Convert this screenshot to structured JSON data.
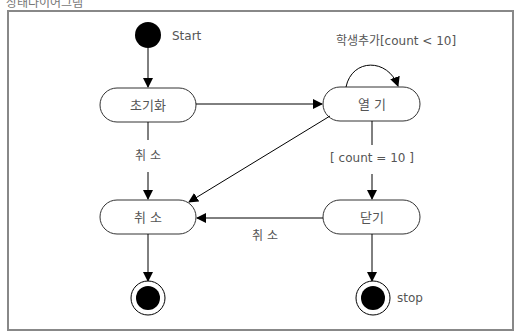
{
  "caption": "상태다이어그램",
  "diagram": {
    "type": "state-diagram",
    "start_label": "Start",
    "stop_label": "stop",
    "states": [
      {
        "id": "init",
        "label": "초기화"
      },
      {
        "id": "open",
        "label": "열 기"
      },
      {
        "id": "cancel",
        "label": "취 소"
      },
      {
        "id": "close",
        "label": "닫기"
      }
    ],
    "transitions": [
      {
        "from": "start",
        "to": "init",
        "label": ""
      },
      {
        "from": "init",
        "to": "open",
        "label": ""
      },
      {
        "from": "init",
        "to": "cancel",
        "label": "취 소"
      },
      {
        "from": "open",
        "to": "open",
        "label": "학생추가[count < 10]"
      },
      {
        "from": "open",
        "to": "cancel",
        "label": ""
      },
      {
        "from": "open",
        "to": "close",
        "label": "[ count = 10 ]"
      },
      {
        "from": "close",
        "to": "cancel",
        "label": "취 소"
      },
      {
        "from": "cancel",
        "to": "end1",
        "label": ""
      },
      {
        "from": "close",
        "to": "end2",
        "label": ""
      }
    ]
  }
}
